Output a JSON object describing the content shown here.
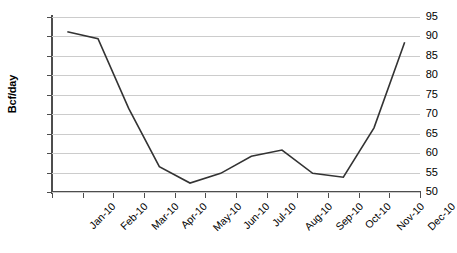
{
  "chart_data": {
    "type": "line",
    "title": "",
    "subtitle": "",
    "xlabel": "",
    "ylabel": "Bcf/day",
    "ylim": [
      50,
      95
    ],
    "ytick_step": 5,
    "yticks": [
      50,
      55,
      60,
      65,
      70,
      75,
      80,
      85,
      90,
      95
    ],
    "ytick_labels": [
      "50",
      "55",
      "60",
      "65",
      "70",
      "75",
      "80",
      "85",
      "90",
      "95"
    ],
    "categories": [
      "Jan-10",
      "Feb-10",
      "Mar-10",
      "Apr-10",
      "May-10",
      "Jun-10",
      "Jul-10",
      "Aug-10",
      "Sep-10",
      "Oct-10",
      "Nov-10",
      "Dec-10"
    ],
    "values": [
      91.2,
      89.4,
      71.5,
      56.5,
      52.3,
      54.8,
      59.2,
      60.8,
      54.8,
      53.8,
      66.5,
      88.5
    ],
    "series": [
      {
        "name": "Bcf/day",
        "values": [
          91.2,
          89.4,
          71.5,
          56.5,
          52.3,
          54.8,
          59.2,
          60.8,
          54.8,
          53.8,
          66.5,
          88.5
        ],
        "color": "#333333"
      }
    ],
    "grid": {
      "horizontal": true,
      "vertical": false,
      "color": "#cccccc"
    },
    "legend": {
      "visible": false,
      "position": "none"
    },
    "markers": false,
    "line_width": 1.6,
    "axis_color": "#4d4d4d",
    "background": "#ffffff",
    "xtick_label_rotation": -45
  }
}
